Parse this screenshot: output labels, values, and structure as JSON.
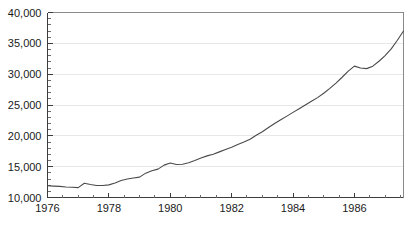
{
  "chart_data": {
    "type": "line",
    "title": "",
    "subtitle": "",
    "xlabel": "",
    "ylabel": "",
    "xlim": [
      1976.0,
      1987.6
    ],
    "ylim": [
      10000,
      40000
    ],
    "grid": true,
    "legend": false,
    "legend_position": "none",
    "y_ticks": [
      10000,
      15000,
      20000,
      25000,
      30000,
      35000,
      40000
    ],
    "y_tick_labels": [
      "10,000",
      "15,000",
      "20,000",
      "25,000",
      "30,000",
      "35,000",
      "40,000"
    ],
    "y_minor_tick_step": 1000,
    "x_ticks": [
      1976,
      1978,
      1980,
      1982,
      1984,
      1986
    ],
    "x_tick_labels": [
      "1976",
      "1978",
      "1980",
      "1982",
      "1984",
      "1986"
    ],
    "x_minor_tick_step": 0.5,
    "line_color": "#4a4a4a",
    "axis_color": "#3c3c3c",
    "grid_color": "#e8e8e8",
    "background_color": "#ffffff",
    "series": [
      {
        "name": "value",
        "x": [
          1976.0,
          1976.2,
          1976.4,
          1976.6,
          1976.8,
          1977.0,
          1977.2,
          1977.4,
          1977.6,
          1977.8,
          1978.0,
          1978.2,
          1978.4,
          1978.6,
          1978.8,
          1979.0,
          1979.2,
          1979.4,
          1979.6,
          1979.8,
          1980.0,
          1980.2,
          1980.4,
          1980.6,
          1980.8,
          1981.0,
          1981.2,
          1981.4,
          1981.6,
          1981.8,
          1982.0,
          1982.2,
          1982.4,
          1982.6,
          1982.8,
          1983.0,
          1983.2,
          1983.4,
          1983.6,
          1983.8,
          1984.0,
          1984.2,
          1984.4,
          1984.6,
          1984.8,
          1985.0,
          1985.2,
          1985.4,
          1985.6,
          1985.8,
          1986.0,
          1986.2,
          1986.4,
          1986.6,
          1986.8,
          1987.0,
          1987.2,
          1987.4,
          1987.6
        ],
        "values": [
          11900,
          11850,
          11800,
          11700,
          11650,
          11600,
          12300,
          12100,
          11950,
          11950,
          12050,
          12350,
          12750,
          13000,
          13150,
          13300,
          13950,
          14350,
          14600,
          15250,
          15600,
          15350,
          15400,
          15650,
          16000,
          16400,
          16750,
          17000,
          17400,
          17800,
          18150,
          18600,
          19000,
          19450,
          20100,
          20650,
          21350,
          22000,
          22600,
          23200,
          23800,
          24400,
          25000,
          25600,
          26200,
          26900,
          27700,
          28550,
          29500,
          30500,
          31300,
          31000,
          30900,
          31300,
          32100,
          33000,
          34100,
          35500,
          37000
        ]
      }
    ]
  }
}
